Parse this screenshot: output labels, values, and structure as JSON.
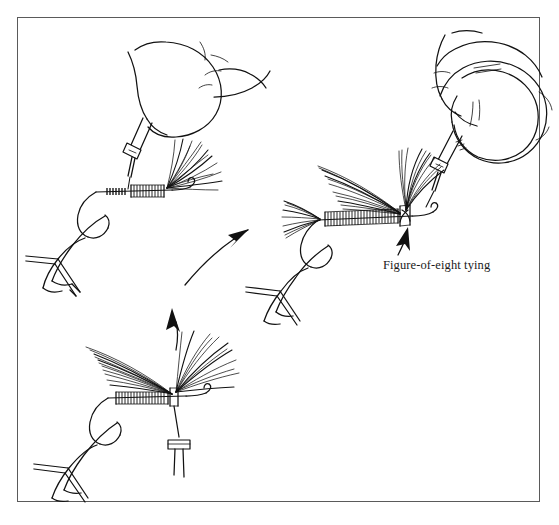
{
  "figure": {
    "title": "Figure-of-eight tying",
    "medium": "pen-and-ink line drawing",
    "border_color": "#5a5a5a",
    "ink_color": "#111111",
    "background_color": "#ffffff"
  },
  "annotations": {
    "figure_of_eight_label": "Figure-of-eight tying"
  },
  "panels": [
    {
      "id": "panel-top-left",
      "name": "bobbin-hand-first-wing",
      "description": "A hand grips the bobbin above the hook; thread descends to the shank where a single feather wing is lashed down.",
      "elements": [
        "hand",
        "bobbin",
        "thread",
        "hook-in-vise",
        "feather-wing",
        "thread-wraps"
      ]
    },
    {
      "id": "panel-bottom-center",
      "name": "both-wings-spread",
      "description": "Hook in vise with two feather wings splayed to either side; bobbin hangs below on the thread.",
      "elements": [
        "hook-in-vise",
        "feather-wing-left",
        "feather-wing-right",
        "thread",
        "hanging-bobbin"
      ]
    },
    {
      "id": "panel-right",
      "name": "figure-of-eight-finish",
      "description": "Finished fly with tail, wrapped body and divided wings; hand and bobbin apply figure-of-eight wraps between the wings.",
      "elements": [
        "hand",
        "bobbin",
        "hook-in-vise",
        "tail",
        "body-wraps",
        "wing-left",
        "wing-right",
        "figure-of-eight-point"
      ]
    }
  ],
  "arrows": [
    {
      "id": "arrow-to-right-panel",
      "name": "curved-arrow-up-right",
      "from_panel": "panel-top-left",
      "to_panel": "panel-right",
      "direction": "up-right"
    },
    {
      "id": "arrow-to-top-panel",
      "name": "curved-arrow-up",
      "from_panel": "panel-bottom-center",
      "to_panel": "panel-top-left",
      "direction": "up"
    },
    {
      "id": "arrow-caption-pointer",
      "name": "caption-pointer-arrow",
      "points_to": "figure-of-eight-point",
      "direction": "up"
    }
  ]
}
